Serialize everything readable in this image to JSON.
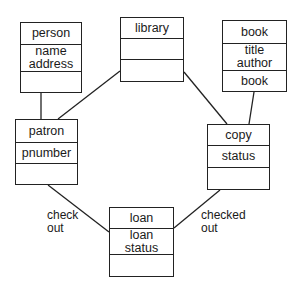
{
  "classes": {
    "person": {
      "name": "person",
      "attributes": [
        "name",
        "address"
      ],
      "operations": []
    },
    "library": {
      "name": "library",
      "attributes": [],
      "operations": []
    },
    "book": {
      "name": "book",
      "attributes": [
        "title",
        "author"
      ],
      "operations": [
        "book"
      ]
    },
    "patron": {
      "name": "patron",
      "attributes": [
        "pnumber"
      ],
      "operations": []
    },
    "copy": {
      "name": "copy",
      "attributes": [
        "status"
      ],
      "operations": []
    },
    "loan": {
      "name": "loan",
      "attributes": [
        "loan",
        "status"
      ],
      "operations": []
    }
  },
  "associations": [
    {
      "from": "person",
      "to": "patron",
      "label": ""
    },
    {
      "from": "library",
      "to": "patron",
      "label": ""
    },
    {
      "from": "library",
      "to": "copy",
      "label": ""
    },
    {
      "from": "book",
      "to": "copy",
      "label": ""
    },
    {
      "from": "patron",
      "to": "loan",
      "label": "check out"
    },
    {
      "from": "copy",
      "to": "loan",
      "label": "checked out"
    }
  ],
  "labels": {
    "check_out_line1": "check",
    "check_out_line2": "out",
    "checked_out_line1": "checked",
    "checked_out_line2": "out"
  }
}
